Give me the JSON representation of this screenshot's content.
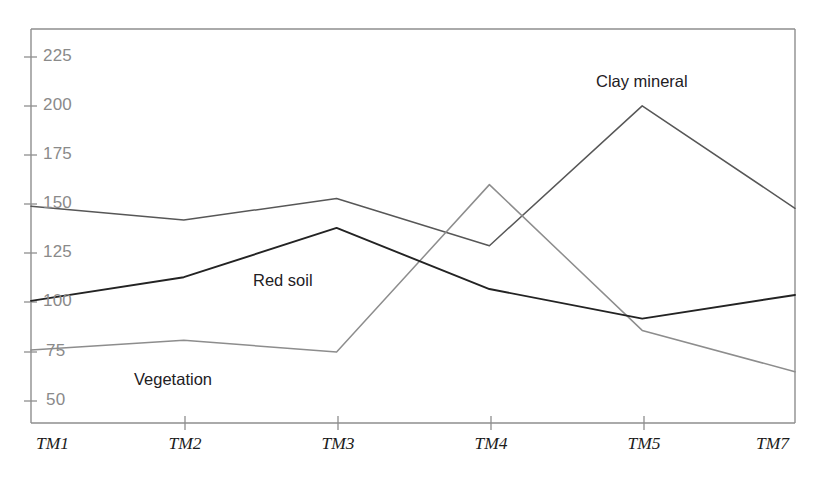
{
  "chart_data": {
    "type": "line",
    "title": "",
    "subtitle": "",
    "xlabel": "",
    "ylabel": "",
    "categories": [
      "TM1",
      "TM2",
      "TM3",
      "TM4",
      "TM5",
      "TM7"
    ],
    "yticks": [
      50,
      75,
      100,
      125,
      150,
      175,
      200,
      225
    ],
    "ylim": [
      36,
      236
    ],
    "grid": false,
    "legend_position": "inline-annotations",
    "series": [
      {
        "name": "Clay mineral",
        "values": [
          146,
          139,
          150,
          126,
          197,
          145
        ],
        "color": "#575757",
        "label_x_category": "TM5",
        "label_text": "Clay mineral"
      },
      {
        "name": "Red soil",
        "values": [
          98,
          110,
          135,
          104,
          89,
          101
        ],
        "color": "#232323",
        "label_x_category": "TM2",
        "label_text": "Red soil"
      },
      {
        "name": "Vegetation",
        "values": [
          73,
          78,
          72,
          157,
          83,
          62
        ],
        "color": "#8d8d8d",
        "label_x_category": "TM2",
        "label_text": "Vegetation"
      }
    ],
    "annotations": [
      {
        "text": "Clay mineral",
        "x": 598,
        "y": 74
      },
      {
        "text": "Red soil",
        "x": 253,
        "y": 273
      },
      {
        "text": "Vegetation",
        "x": 134,
        "y": 372
      }
    ],
    "axis": {
      "frame_color": "#888888",
      "left_x": 31,
      "right_x": 795,
      "top_y": 29,
      "bottom_y": 423
    }
  },
  "ytick_labels": {
    "t225": "225",
    "t200": "200",
    "t175": "175",
    "t150": "150",
    "t125": "125",
    "t100": "100",
    "t75": "75",
    "t50": "50"
  },
  "xtick_labels": {
    "c0": "TM1",
    "c1": "TM2",
    "c2": "TM3",
    "c3": "TM4",
    "c4": "TM5",
    "c5": "TM7"
  },
  "series_labels": {
    "clay": "Clay mineral",
    "red_soil": "Red soil",
    "vegetation": "Vegetation"
  }
}
